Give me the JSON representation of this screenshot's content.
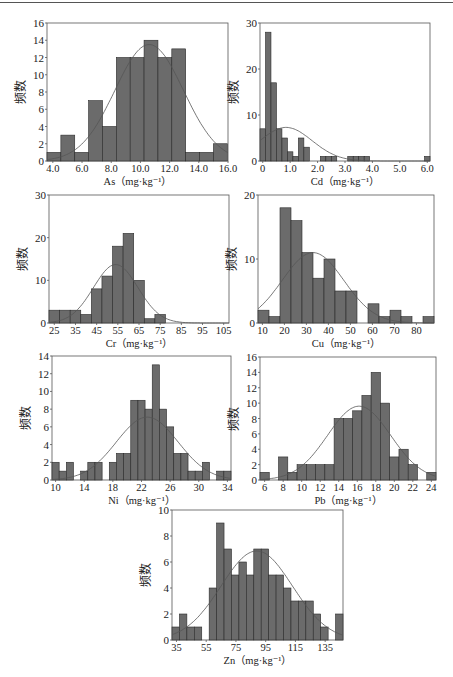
{
  "ylabel": "频数",
  "colors": {
    "bar_fill": "#6b6b6b",
    "bar_edge": "#2a2a2a",
    "curve": "#555555",
    "frame": "#555555",
    "text": "#222222"
  },
  "chart_data": [
    {
      "id": "As",
      "type": "bar",
      "title": "As（mg·kg⁻¹）",
      "xlabel": "As（mg·kg⁻¹）",
      "ylabel": "频数",
      "bin_start": 3.6,
      "bin_width": 0.95,
      "values": [
        1,
        3,
        1,
        7,
        4,
        12,
        12,
        14,
        12,
        13,
        1,
        1,
        2
      ],
      "xlim": [
        3.6,
        16.0
      ],
      "ylim": [
        0,
        16
      ],
      "xticks": [
        4.0,
        6.0,
        8.0,
        10.0,
        12.0,
        14.0,
        16.0
      ],
      "xtick_labels": [
        "4.0",
        "6.0",
        "8.0",
        "10.0",
        "12.0",
        "14.0",
        "16.0"
      ],
      "yticks": [
        0,
        2,
        4,
        6,
        8,
        10,
        12,
        14,
        16
      ],
      "normal_curve": {
        "mean": 10.6,
        "sd": 2.35,
        "peak": 13.5
      },
      "box": {
        "left": 47,
        "top": 23,
        "width": 181,
        "height": 138
      }
    },
    {
      "id": "Cd",
      "type": "bar",
      "title": "Cd（mg·kg⁻¹）",
      "xlabel": "Cd（mg·kg⁻¹）",
      "ylabel": "频数",
      "bin_start": -0.1,
      "bin_width": 0.2,
      "values": [
        7,
        28,
        17,
        7,
        5,
        2,
        1,
        5,
        3,
        0,
        0,
        1,
        1,
        1,
        0,
        0,
        1,
        1,
        1,
        1,
        0,
        0,
        0,
        0,
        0,
        0,
        0,
        0,
        0,
        0,
        1
      ],
      "xlim": [
        -0.1,
        6.1
      ],
      "ylim": [
        0,
        30
      ],
      "xticks": [
        0,
        1.0,
        2.0,
        3.0,
        4.0,
        5.0,
        6.0
      ],
      "xtick_labels": [
        "0",
        "1.0",
        "2.0",
        "3.0",
        "4.0",
        "5.0",
        "6.0"
      ],
      "yticks": [
        0,
        10,
        20,
        30
      ],
      "normal_curve": {
        "mean": 0.85,
        "sd": 0.95,
        "peak": 7.3
      },
      "box": {
        "left": 260,
        "top": 23,
        "width": 170,
        "height": 138
      }
    },
    {
      "id": "Cr",
      "type": "bar",
      "title": "Cr（mg·kg⁻¹）",
      "xlabel": "Cr（mg·kg⁻¹）",
      "ylabel": "频数",
      "bin_start": 22.5,
      "bin_width": 5,
      "values": [
        3,
        3,
        3,
        2,
        8,
        11,
        18,
        21,
        10,
        1,
        2,
        0,
        0,
        0,
        0,
        0,
        0,
        1
      ],
      "xlim": [
        22.5,
        107.5
      ],
      "ylim": [
        0,
        30
      ],
      "xticks": [
        25,
        35,
        45,
        55,
        65,
        75,
        85,
        95,
        105
      ],
      "xtick_labels": [
        "25",
        "35",
        "45",
        "55",
        "65",
        "75",
        "85",
        "95",
        "105"
      ],
      "yticks": [
        0,
        10,
        20,
        30
      ],
      "normal_curve": {
        "mean": 54,
        "sd": 10.5,
        "peak": 13.7
      },
      "box": {
        "left": 49,
        "top": 195,
        "width": 180,
        "height": 128
      }
    },
    {
      "id": "Cu",
      "type": "bar",
      "title": "Cu（mg·kg⁻¹）",
      "xlabel": "Cu（mg·kg⁻¹）",
      "ylabel": "频数",
      "bin_start": 8,
      "bin_width": 5,
      "values": [
        2,
        1,
        18,
        16,
        11,
        7,
        10,
        5,
        5,
        0,
        3,
        1,
        2,
        1,
        0,
        1
      ],
      "xlim": [
        8,
        88
      ],
      "ylim": [
        0,
        20
      ],
      "xticks": [
        10,
        20,
        30,
        40,
        50,
        60,
        70,
        80
      ],
      "xtick_labels": [
        "10",
        "20",
        "30",
        "40",
        "50",
        "60",
        "70",
        "80"
      ],
      "yticks": [
        0,
        10,
        20
      ],
      "normal_curve": {
        "mean": 33,
        "sd": 14,
        "peak": 11
      },
      "box": {
        "left": 258,
        "top": 195,
        "width": 176,
        "height": 128
      }
    },
    {
      "id": "Ni",
      "type": "bar",
      "title": "Ni（mg·kg⁻¹）",
      "xlabel": "Ni（mg·kg⁻¹）",
      "ylabel": "频数",
      "bin_start": 9.5,
      "bin_width": 1,
      "values": [
        2,
        1,
        2,
        0,
        1,
        2,
        2,
        0,
        2,
        3,
        3,
        9,
        9,
        8,
        13,
        8,
        6,
        3,
        3,
        1,
        1,
        2,
        0,
        1,
        1
      ],
      "xlim": [
        9.5,
        34.5
      ],
      "ylim": [
        0,
        14
      ],
      "xticks": [
        10,
        14,
        18,
        22,
        26,
        30,
        34
      ],
      "xtick_labels": [
        "10",
        "14",
        "18",
        "22",
        "26",
        "30",
        "34"
      ],
      "yticks": [
        0,
        2,
        4,
        6,
        8,
        10,
        12,
        14
      ],
      "normal_curve": {
        "mean": 22.8,
        "sd": 4.3,
        "peak": 7.1
      },
      "box": {
        "left": 52,
        "top": 356,
        "width": 179,
        "height": 124
      }
    },
    {
      "id": "Pb",
      "type": "bar",
      "title": "Pb（mg·kg⁻¹）",
      "xlabel": "Pb（mg·kg⁻¹）",
      "ylabel": "频数",
      "bin_start": 5.5,
      "bin_width": 1,
      "values": [
        1,
        0,
        3,
        1,
        2,
        2,
        2,
        2,
        8,
        8,
        9,
        11,
        14,
        10,
        3,
        4,
        2,
        0,
        1
      ],
      "xlim": [
        5.5,
        24.5
      ],
      "ylim": [
        0,
        16
      ],
      "xticks": [
        6,
        8,
        10,
        12,
        14,
        16,
        18,
        20,
        22,
        24
      ],
      "xtick_labels": [
        "6",
        "8",
        "10",
        "12",
        "14",
        "16",
        "18",
        "20",
        "22",
        "24"
      ],
      "yticks": [
        0,
        2,
        4,
        6,
        8,
        10,
        12,
        14,
        16
      ],
      "normal_curve": {
        "mean": 16.2,
        "sd": 3.4,
        "peak": 9.6
      },
      "box": {
        "left": 260,
        "top": 357,
        "width": 176,
        "height": 123
      }
    },
    {
      "id": "Zn",
      "type": "bar",
      "title": "Zn（mg·kg⁻¹）",
      "xlabel": "Zn（mg·kg⁻¹）",
      "ylabel": "频数",
      "bin_start": 32,
      "bin_width": 5,
      "values": [
        1,
        2,
        1,
        1,
        0,
        4,
        9,
        7,
        5,
        6,
        5,
        7,
        7,
        5,
        5,
        4,
        3,
        3,
        3,
        2,
        1,
        0,
        2
      ],
      "xlim": [
        32,
        147
      ],
      "ylim": [
        0,
        10
      ],
      "xticks": [
        35,
        55,
        75,
        95,
        115,
        135
      ],
      "xtick_labels": [
        "35",
        "55",
        "75",
        "95",
        "115",
        "135"
      ],
      "yticks": [
        0,
        2,
        4,
        6,
        8,
        10
      ],
      "normal_curve": {
        "mean": 89,
        "sd": 24,
        "peak": 6.85
      },
      "box": {
        "left": 172,
        "top": 510,
        "width": 171,
        "height": 130
      }
    }
  ]
}
